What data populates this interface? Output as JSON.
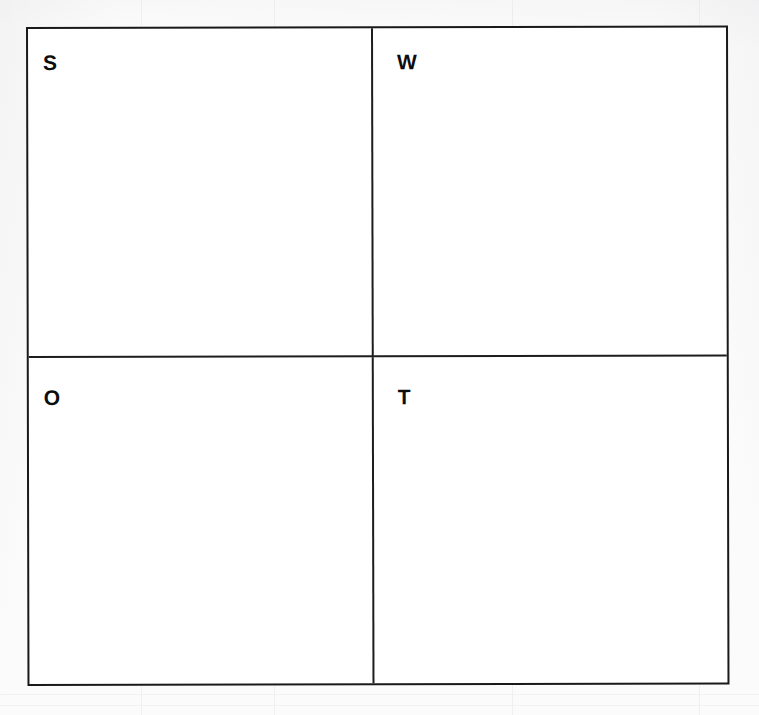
{
  "document": {
    "kind": "swot-matrix-worksheet",
    "title": "SWOT Matrix",
    "background_color": "#fbfbfb",
    "frame_color": "#191919",
    "letter_color": "#0d0d0d",
    "quadrant_count": 4
  },
  "matrix": {
    "quadrants": [
      {
        "id": "strengths",
        "letter": "S",
        "position": "top-left",
        "content": ""
      },
      {
        "id": "weaknesses",
        "letter": "W",
        "position": "top-right",
        "content": ""
      },
      {
        "id": "opportunities",
        "letter": "O",
        "position": "bottom-left",
        "content": ""
      },
      {
        "id": "threats",
        "letter": "T",
        "position": "bottom-right",
        "content": ""
      }
    ]
  }
}
